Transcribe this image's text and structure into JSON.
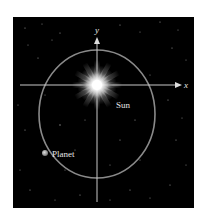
{
  "diagram": {
    "title": "",
    "background_color": "#000000",
    "orbit_color": "#8a8a8a",
    "axis_color": "#c8c8c8",
    "label_color": "#e6e6e6",
    "axes": {
      "x_label": "x",
      "y_label": "y"
    },
    "sun": {
      "label": "Sun"
    },
    "planet": {
      "label": "Planet"
    },
    "orbit_shape": "ellipse"
  }
}
